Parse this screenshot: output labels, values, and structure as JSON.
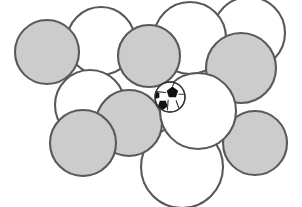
{
  "figure": {
    "width": 302,
    "height": 207,
    "background_color": "#FFFFFF"
  },
  "style": {
    "sphere_fill_shaded": "#CCCCCC",
    "sphere_fill_plain": "#FFFFFF",
    "sphere_stroke": "#595959",
    "sphere_stroke_width": 2.1,
    "ball_panel_dark": "#111111",
    "ball_panel_light": "#FFFFFF",
    "ball_stroke": "#333333"
  },
  "spheres": [
    {
      "id": "sphere-top-left-shaded",
      "label": "top left shaded sphere",
      "cx": 47,
      "cy": 52,
      "r": 32,
      "shade": "shaded",
      "z": 6
    },
    {
      "id": "sphere-top-center-left-plain",
      "label": "top center-left plain sphere",
      "cx": 101,
      "cy": 41,
      "r": 34,
      "shade": "plain",
      "z": 3
    },
    {
      "id": "sphere-top-center-shaded",
      "label": "top center shaded sphere",
      "cx": 149,
      "cy": 56,
      "r": 31,
      "shade": "shaded",
      "z": 7
    },
    {
      "id": "sphere-top-center-right-plain",
      "label": "top center-right plain sphere",
      "cx": 190,
      "cy": 38,
      "r": 36,
      "shade": "plain",
      "z": 2
    },
    {
      "id": "sphere-top-right-plain",
      "label": "top right plain sphere",
      "cx": 249,
      "cy": 33,
      "r": 36,
      "shade": "plain",
      "z": 1
    },
    {
      "id": "sphere-right-upper-shaded",
      "label": "right upper shaded sphere",
      "cx": 241,
      "cy": 68,
      "r": 35,
      "shade": "shaded",
      "z": 5
    },
    {
      "id": "sphere-middle-left-plain",
      "label": "middle left plain sphere",
      "cx": 90,
      "cy": 105,
      "r": 35,
      "shade": "plain",
      "z": 3
    },
    {
      "id": "sphere-middle-shaded",
      "label": "middle shaded sphere",
      "cx": 129,
      "cy": 123,
      "r": 33,
      "shade": "shaded",
      "z": 6
    },
    {
      "id": "sphere-lower-left-shaded",
      "label": "lower left shaded sphere",
      "cx": 83,
      "cy": 143,
      "r": 33,
      "shade": "shaded",
      "z": 7
    },
    {
      "id": "sphere-right-center-plain",
      "label": "right center plain sphere",
      "cx": 198,
      "cy": 111,
      "r": 38,
      "shade": "plain",
      "z": 8
    },
    {
      "id": "sphere-bottom-center-plain",
      "label": "bottom center plain sphere",
      "cx": 182,
      "cy": 167,
      "r": 41,
      "shade": "plain",
      "z": 4
    },
    {
      "id": "sphere-bottom-right-shaded",
      "label": "bottom right shaded sphere",
      "cx": 255,
      "cy": 143,
      "r": 32,
      "shade": "shaded",
      "z": 5
    }
  ],
  "soccer_ball": {
    "id": "soccer-ball",
    "label": "soccer ball in interstitial void",
    "cx": 170,
    "cy": 97,
    "r": 15,
    "panel_count": 5,
    "shade": "patterned"
  }
}
